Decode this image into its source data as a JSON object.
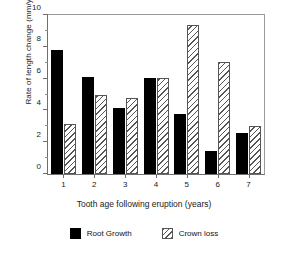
{
  "chart_data": {
    "type": "bar",
    "title": "",
    "xlabel": "Tooth age following eruption (years)",
    "ylabel": "Rate of length change (mm/year)",
    "categories": [
      "1",
      "2",
      "3",
      "4",
      "5",
      "6",
      "7"
    ],
    "series": [
      {
        "name": "Root Growth",
        "color": "#000000",
        "fill": "solid",
        "values": [
          7.8,
          6.1,
          4.15,
          6.05,
          3.75,
          1.45,
          2.55
        ]
      },
      {
        "name": "Crown loss",
        "color": "#555555",
        "fill": "hatched",
        "values": [
          3.15,
          5.0,
          4.75,
          6.05,
          9.35,
          7.05,
          3.05
        ]
      }
    ],
    "ylim": [
      0,
      10
    ],
    "yticks": [
      0,
      2,
      4,
      6,
      8,
      10
    ],
    "yticklabels": [
      "0",
      "2",
      "4",
      "6",
      "8",
      "10"
    ],
    "yminorticks": [
      1,
      3,
      5,
      7,
      9
    ],
    "grid": false,
    "legend_position": "bottom-center"
  },
  "legend": {
    "items": [
      {
        "label": "Root Growth",
        "swatch": "solid-black-square"
      },
      {
        "label": "Crown loss",
        "swatch": "hatched-square"
      }
    ]
  }
}
